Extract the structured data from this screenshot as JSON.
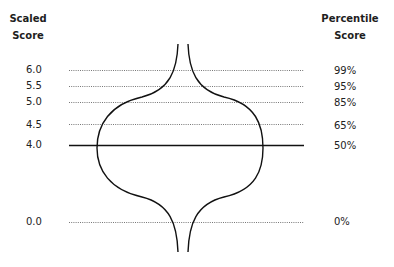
{
  "headers": {
    "left": [
      "Scaled",
      "Score"
    ],
    "right": [
      "Percentile",
      "Score"
    ]
  },
  "rows": [
    {
      "scaled": "6.0",
      "percentile": "99%",
      "y": 70,
      "style": "dotted"
    },
    {
      "scaled": "5.5",
      "percentile": "95%",
      "y": 86,
      "style": "dotted"
    },
    {
      "scaled": "5.0",
      "percentile": "85%",
      "y": 102,
      "style": "dotted"
    },
    {
      "scaled": "4.5",
      "percentile": "65%",
      "y": 124,
      "style": "dotted"
    },
    {
      "scaled": "4.0",
      "percentile": "50%",
      "y": 145,
      "style": "solid"
    },
    {
      "scaled": "0.0",
      "percentile": "0%",
      "y": 222,
      "style": "dotted"
    }
  ],
  "colors": {
    "line": "#111111",
    "dotted": "#777777",
    "text": "#222222"
  }
}
